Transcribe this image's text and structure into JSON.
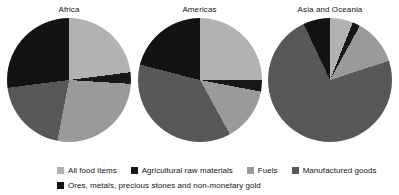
{
  "chart_data": {
    "type": "pie",
    "title": "",
    "subtitle": "",
    "legend_position": "bottom",
    "grid": false,
    "categories": [
      "All food items",
      "Agricultural raw materials",
      "Fuels",
      "Manufactured goods",
      "Ores, metals, precious stones and non-monetary gold"
    ],
    "colors": {
      "all_food_items": "#b2b2b2",
      "agricultural_raw_materials": "#171717",
      "fuels": "#9a9a9a",
      "manufactured_goods": "#585858",
      "ores_metals_precious_stones_and_non_monetary_gold": "#131313"
    },
    "units": "percent of total exports",
    "charts": [
      {
        "title": "Africa",
        "values": [
          23,
          3,
          27,
          20,
          27
        ],
        "slices": [
          {
            "label": "All food items",
            "value": 23,
            "color": "#b2b2b2"
          },
          {
            "label": "Agricultural raw materials",
            "value": 3,
            "color": "#171717"
          },
          {
            "label": "Fuels",
            "value": 27,
            "color": "#9a9a9a"
          },
          {
            "label": "Manufactured goods",
            "value": 20,
            "color": "#585858"
          },
          {
            "label": "Ores, metals, precious stones and non-monetary gold",
            "value": 27,
            "color": "#131313"
          }
        ]
      },
      {
        "title": "Americas",
        "values": [
          25,
          3,
          14,
          37,
          21
        ],
        "slices": [
          {
            "label": "All food items",
            "value": 25,
            "color": "#b2b2b2"
          },
          {
            "label": "Agricultural raw materials",
            "value": 3,
            "color": "#171717"
          },
          {
            "label": "Fuels",
            "value": 14,
            "color": "#9a9a9a"
          },
          {
            "label": "Manufactured goods",
            "value": 37,
            "color": "#585858"
          },
          {
            "label": "Ores, metals, precious stones and non-monetary gold",
            "value": 21,
            "color": "#131313"
          }
        ]
      },
      {
        "title": "Asia and Oceania",
        "values": [
          6,
          2,
          12,
          73,
          7
        ],
        "slices": [
          {
            "label": "All food items",
            "value": 6,
            "color": "#b2b2b2"
          },
          {
            "label": "Agricultural raw materials",
            "value": 2,
            "color": "#171717"
          },
          {
            "label": "Fuels",
            "value": 12,
            "color": "#9a9a9a"
          },
          {
            "label": "Manufactured goods",
            "value": 73,
            "color": "#585858"
          },
          {
            "label": "Ores, metals, precious stones and non-monetary gold",
            "value": 7,
            "color": "#131313"
          }
        ]
      }
    ]
  },
  "panels": [
    {
      "title": "Africa"
    },
    {
      "title": "Americas"
    },
    {
      "title": "Asia and Oceania"
    }
  ],
  "legend": {
    "row1": [
      {
        "label": "All food items",
        "color": "#b2b2b2"
      },
      {
        "label": "Agricultural raw materials",
        "color": "#171717"
      },
      {
        "label": "Fuels",
        "color": "#9a9a9a"
      },
      {
        "label": "Manufactured goods",
        "color": "#585858"
      }
    ],
    "row2": [
      {
        "label": "Ores, metals, precious stones and non-monetary gold",
        "color": "#131313"
      }
    ]
  }
}
